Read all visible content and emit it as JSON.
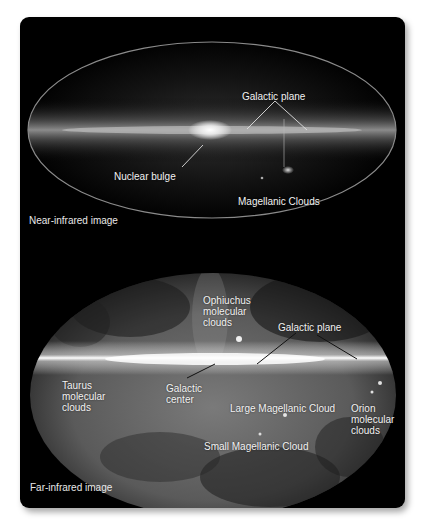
{
  "figure": {
    "panels": [
      {
        "id": "near",
        "caption": "Near-infrared image",
        "labels": {
          "galactic_plane": "Galactic plane",
          "nuclear_bulge": "Nuclear bulge",
          "magellanic_clouds": "Magellanic Clouds"
        }
      },
      {
        "id": "far",
        "caption": "Far-infrared image",
        "labels": {
          "ophiuchus": "Ophiuchus\nmolecular\nclouds",
          "galactic_plane": "Galactic plane",
          "taurus": "Taurus\nmolecular\nclouds",
          "galactic_center": "Galactic\ncenter",
          "large_magellanic": "Large Magellanic Cloud",
          "orion": "Orion\nmolecular\nclouds",
          "small_magellanic": "Small Magellanic Cloud"
        }
      }
    ],
    "colors": {
      "background": "#000000",
      "label": "#f2f2f2",
      "near_outline": "#8a8a8a",
      "page": "#ffffff"
    }
  }
}
